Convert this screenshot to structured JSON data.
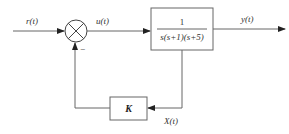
{
  "diagram": {
    "type": "feedback-control-block-diagram",
    "signals": {
      "input": "r(t)",
      "error": "u(t)",
      "output": "y(t)",
      "feedback": "X(t)"
    },
    "summing_junction": {
      "feedback_sign": "−"
    },
    "plant": {
      "numerator": "1",
      "denominator": "s(s+1)(s+5)"
    },
    "feedback_block": {
      "gain": "K"
    },
    "colors": {
      "line": "#666666",
      "text": "#333333",
      "background": "#ffffff"
    }
  }
}
